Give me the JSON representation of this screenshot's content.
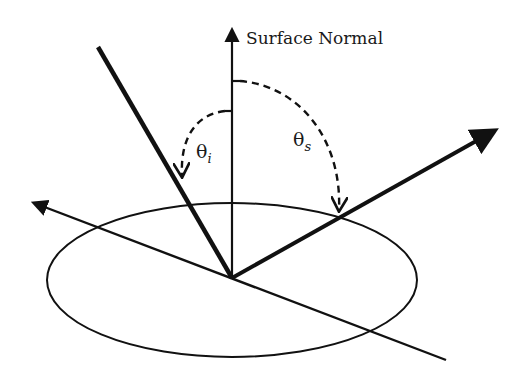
{
  "diagram": {
    "normal_label": "Surface Normal",
    "theta_i": {
      "symbol": "θ",
      "subscript": "i"
    },
    "theta_s": {
      "symbol": "θ",
      "subscript": "s"
    },
    "colors": {
      "stroke": "#111111",
      "background": "#ffffff"
    },
    "elements": {
      "surface_ellipse": {
        "cx": 232,
        "cy": 280,
        "rx": 185,
        "ry": 77
      },
      "surface_normal": {
        "from": [
          232,
          278
        ],
        "to": [
          232,
          28
        ]
      },
      "incident_ray": {
        "from": [
          98,
          47
        ],
        "to": [
          232,
          278
        ]
      },
      "scattered_ray": {
        "from": [
          232,
          278
        ],
        "to": [
          498,
          129
        ]
      },
      "surface_line": {
        "from": [
          32,
          202
        ],
        "to": [
          446,
          360
        ]
      }
    }
  }
}
